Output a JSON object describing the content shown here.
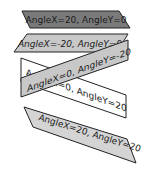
{
  "canvas": {
    "background": "#ffffff"
  },
  "shapes": [
    {
      "label": "AngleX=20, AngleY=0",
      "fill": "#7a7a7a",
      "stroke": "#222222"
    },
    {
      "label": "AngleX=-20, AngleY=0",
      "fill": "#c8c8c8",
      "stroke": "#222222"
    },
    {
      "label": "AngleX=0, AngleY=20",
      "fill": "#ffffff",
      "stroke": "#222222"
    },
    {
      "label": "AngleX=0, AngleY=-20",
      "fill": "#c8c8c8",
      "stroke": "#222222"
    },
    {
      "label": "AngleX=20, AngleY=20",
      "fill": "#d4d4d4",
      "stroke": "#222222"
    }
  ]
}
